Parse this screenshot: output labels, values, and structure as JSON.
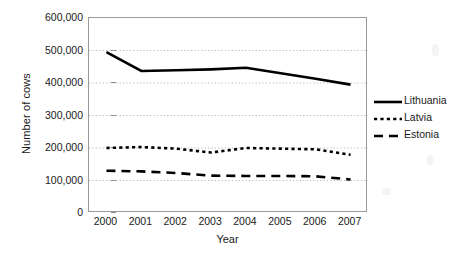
{
  "chart_data": {
    "type": "line",
    "title": "",
    "xlabel": "Year",
    "ylabel": "Number of cows",
    "x": [
      2000,
      2001,
      2002,
      2003,
      2004,
      2005,
      2006,
      2007
    ],
    "xtick_labels": [
      "2000",
      "2001",
      "2002",
      "2003",
      "2004",
      "2005",
      "2006",
      "2007"
    ],
    "ytick_labels": [
      "600,000",
      "500,000",
      "400,000",
      "300,000",
      "200,000",
      "100,000",
      "0"
    ],
    "ytick_values": [
      600000,
      500000,
      400000,
      300000,
      200000,
      100000,
      0
    ],
    "ylim": [
      0,
      600000
    ],
    "ytick_step": 100000,
    "grid": "horizontal-dotted",
    "legend_position": "right",
    "series": [
      {
        "name": "Lithuania",
        "style": "solid",
        "color": "#000000",
        "values": [
          495000,
          437000,
          439000,
          442000,
          447000,
          430000,
          413000,
          395000
        ]
      },
      {
        "name": "Latvia",
        "style": "dotted",
        "color": "#000000",
        "values": [
          200000,
          203000,
          198000,
          186000,
          200000,
          198000,
          196000,
          179000
        ]
      },
      {
        "name": "Estonia",
        "style": "dashed",
        "color": "#000000",
        "values": [
          130000,
          128000,
          123000,
          115000,
          114000,
          114000,
          113000,
          103000
        ]
      }
    ]
  },
  "legend": {
    "items": [
      {
        "label": "Lithuania",
        "style": "solid"
      },
      {
        "label": "Latvia",
        "style": "dotted"
      },
      {
        "label": "Estonia",
        "style": "dashed"
      }
    ]
  },
  "axes": {
    "y_title": "Number of cows",
    "x_title": "Year"
  }
}
